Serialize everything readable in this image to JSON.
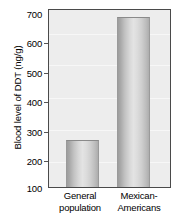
{
  "chart_data": {
    "type": "bar",
    "title": "",
    "xlabel": "",
    "ylabel": "Blood level of DDT (ng/g)",
    "categories": [
      "General population",
      "Mexican-Americans"
    ],
    "category_lines": [
      [
        "General",
        "population"
      ],
      [
        "Mexican-",
        "Americans"
      ]
    ],
    "values": [
      260,
      675
    ],
    "ylim": [
      100,
      700
    ],
    "yticks": [
      100,
      200,
      300,
      400,
      500,
      600,
      700
    ],
    "ytick_labels": [
      "100",
      "200",
      "300",
      "400",
      "500",
      "600",
      "700"
    ],
    "grid": false,
    "legend": null,
    "units": "ng/g",
    "series": [
      {
        "name": "Blood level of DDT",
        "values": [
          260,
          675
        ]
      }
    ],
    "colors": {
      "plot_background": "#ededed",
      "frame": "#4a4a4a",
      "bar_light": "#e3e3e3",
      "bar_dark": "#9d9d9d",
      "text": "#000000"
    }
  }
}
